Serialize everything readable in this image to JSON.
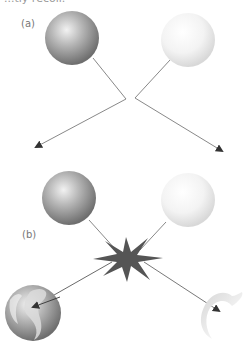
{
  "caption": {
    "partial_text": "...tly recoil."
  },
  "panels": [
    {
      "label": "(a)",
      "description": "Two spheres approach along converging paths and deflect away",
      "sphere_left": {
        "shade": "dark-gray",
        "color": "#8c8c8c"
      },
      "sphere_right": {
        "shade": "light-gray",
        "color": "#e6e6e6"
      }
    },
    {
      "label": "(b)",
      "description": "Two spheres collide producing a burst; fragmented spheres move apart",
      "sphere_left": {
        "shade": "dark-gray",
        "color": "#8c8c8c"
      },
      "sphere_right": {
        "shade": "light-gray",
        "color": "#e6e6e6"
      },
      "burst_color": "#555555"
    }
  ],
  "colors": {
    "line": "#6a6a6a",
    "arrowhead": "#333333"
  }
}
